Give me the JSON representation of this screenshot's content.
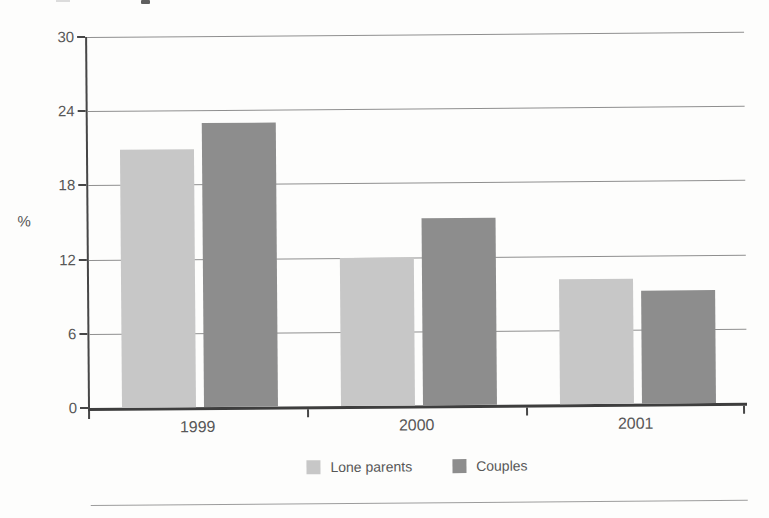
{
  "chart_data": {
    "type": "bar",
    "title": "",
    "categories": [
      "1999",
      "2000",
      "2001"
    ],
    "series": [
      {
        "name": "Lone parents",
        "color": "#c7c7c7",
        "values": [
          20.9,
          12.0,
          10.1
        ]
      },
      {
        "name": "Couples",
        "color": "#8d8d8d",
        "values": [
          23.0,
          15.1,
          9.1
        ]
      }
    ],
    "xlabel": "",
    "ylabel": "%",
    "ylim": [
      0,
      30
    ],
    "yticks": [
      0,
      6,
      12,
      18,
      24,
      30
    ],
    "grid": true,
    "legend_position": "bottom"
  },
  "colors": {
    "axis": "#474747",
    "gridline": "#8f8f8f",
    "text": "#595959",
    "background": "#fdfdfc"
  }
}
